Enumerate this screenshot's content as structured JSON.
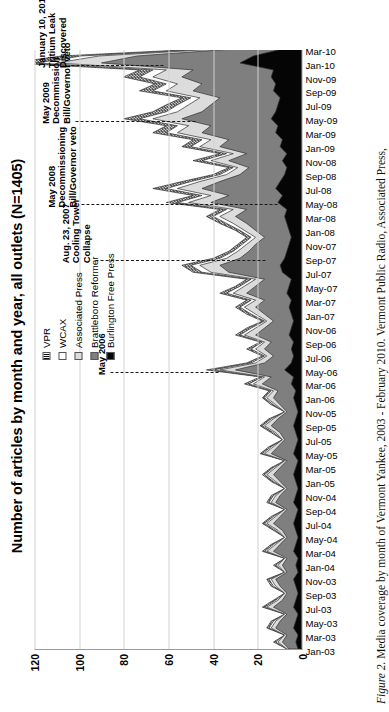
{
  "figure": {
    "caption_label": "Figure 2.",
    "caption_text": " Media coverage by month of Vermont Yankee, 2003 - February 2010. Vermont Public Radio, Associated Press,"
  },
  "legend": {
    "position": "top-right",
    "items": [
      {
        "label": "VPR",
        "swatch": "hatched",
        "color": "#2b2b2b"
      },
      {
        "label": "WCAX",
        "swatch": "white",
        "color": "#ffffff"
      },
      {
        "label": "Associated Press",
        "swatch": "light-gray",
        "color": "#dcdcdc"
      },
      {
        "label": "Brattleboro Reformer",
        "swatch": "mid-gray",
        "color": "#7f7f7f"
      },
      {
        "label": "Burlington Free Press",
        "swatch": "black",
        "color": "#050505"
      }
    ]
  },
  "annotations": [
    {
      "id": "may-2006",
      "lines": [
        "May 2006"
      ]
    },
    {
      "id": "cooling-tower",
      "lines": [
        "Aug. 23, 2007",
        "Cooling Tower",
        "Collapse"
      ]
    },
    {
      "id": "may-2008-veto",
      "lines": [
        "May 2008",
        "Decommissioning",
        "Bill/Governor veto"
      ]
    },
    {
      "id": "may-2009-veto",
      "lines": [
        "May 2009",
        "Decommission",
        "Bill/Governor veto"
      ]
    },
    {
      "id": "tritium-leak",
      "lines": [
        "January 10, 2010",
        "Tritium Leak",
        "Discovered"
      ]
    }
  ],
  "chart_data": {
    "type": "area",
    "title": "Number of articles by month and year, all outlets (N=1405)",
    "xlabel": "",
    "ylabel": "",
    "ylim": [
      0,
      120
    ],
    "yticks": [
      0,
      20,
      40,
      60,
      80,
      100,
      120
    ],
    "grid": true,
    "stacked": true,
    "categories": [
      "Jan-03",
      "Feb-03",
      "Mar-03",
      "Apr-03",
      "May-03",
      "Jun-03",
      "Jul-03",
      "Aug-03",
      "Sep-03",
      "Oct-03",
      "Nov-03",
      "Dec-03",
      "Jan-04",
      "Feb-04",
      "Mar-04",
      "Apr-04",
      "May-04",
      "Jun-04",
      "Jul-04",
      "Aug-04",
      "Sep-04",
      "Oct-04",
      "Nov-04",
      "Dec-04",
      "Jan-05",
      "Feb-05",
      "Mar-05",
      "Apr-05",
      "May-05",
      "Jun-05",
      "Jul-05",
      "Aug-05",
      "Sep-05",
      "Oct-05",
      "Nov-05",
      "Dec-05",
      "Jan-06",
      "Feb-06",
      "Mar-06",
      "Apr-06",
      "May-06",
      "Jun-06",
      "Jul-06",
      "Aug-06",
      "Sep-06",
      "Oct-06",
      "Nov-06",
      "Dec-06",
      "Jan-07",
      "Feb-07",
      "Mar-07",
      "Apr-07",
      "May-07",
      "Jun-07",
      "Jul-07",
      "Aug-07",
      "Sep-07",
      "Oct-07",
      "Nov-07",
      "Dec-07",
      "Jan-08",
      "Feb-08",
      "Mar-08",
      "Apr-08",
      "May-08",
      "Jun-08",
      "Jul-08",
      "Aug-08",
      "Sep-08",
      "Oct-08",
      "Nov-08",
      "Dec-08",
      "Jan-09",
      "Feb-09",
      "Mar-09",
      "Apr-09",
      "May-09",
      "Jun-09",
      "Jul-09",
      "Aug-09",
      "Sep-09",
      "Oct-09",
      "Nov-09",
      "Dec-09",
      "Jan-10",
      "Feb-10",
      "Mar-10"
    ],
    "tick_labels": [
      "Jan-03",
      "Mar-03",
      "May-03",
      "Jul-03",
      "Sep-03",
      "Nov-03",
      "Jan-04",
      "Mar-04",
      "May-04",
      "Jul-04",
      "Sep-04",
      "Nov-04",
      "Jan-05",
      "Mar-05",
      "May-05",
      "Jul-05",
      "Sep-05",
      "Nov-05",
      "Jan-06",
      "Mar-06",
      "May-06",
      "Jul-06",
      "Sep-06",
      "Nov-06",
      "Jan-07",
      "Mar-07",
      "May-07",
      "Jul-07",
      "Sep-07",
      "Nov-07",
      "Jan-08",
      "Mar-08",
      "May-08",
      "Jul-08",
      "Sep-08",
      "Nov-08",
      "Jan-09",
      "Mar-09",
      "May-09",
      "Jul-09",
      "Sep-09",
      "Nov-09",
      "Jan-10",
      "Mar-10"
    ],
    "series": [
      {
        "name": "Burlington Free Press",
        "color": "#050505",
        "values": [
          2,
          3,
          2,
          4,
          3,
          2,
          4,
          3,
          2,
          3,
          4,
          2,
          3,
          2,
          4,
          3,
          2,
          3,
          4,
          3,
          2,
          4,
          3,
          2,
          3,
          4,
          3,
          2,
          4,
          3,
          2,
          3,
          4,
          3,
          2,
          3,
          4,
          3,
          5,
          4,
          8,
          5,
          4,
          5,
          4,
          6,
          5,
          4,
          5,
          6,
          5,
          7,
          6,
          5,
          9,
          10,
          8,
          7,
          6,
          5,
          6,
          7,
          8,
          7,
          11,
          9,
          12,
          10,
          8,
          7,
          9,
          7,
          10,
          9,
          12,
          11,
          14,
          12,
          11,
          10,
          13,
          12,
          14,
          13,
          28,
          22,
          9
        ]
      },
      {
        "name": "Brattleboro Reformer",
        "color": "#7f7f7f",
        "values": [
          4,
          6,
          5,
          8,
          7,
          5,
          9,
          6,
          5,
          7,
          8,
          5,
          6,
          5,
          9,
          7,
          5,
          6,
          9,
          7,
          5,
          8,
          7,
          5,
          7,
          9,
          7,
          5,
          10,
          8,
          6,
          7,
          10,
          8,
          5,
          7,
          9,
          8,
          13,
          10,
          22,
          12,
          9,
          12,
          10,
          15,
          12,
          9,
          12,
          15,
          12,
          18,
          15,
          12,
          24,
          27,
          20,
          17,
          15,
          12,
          15,
          18,
          22,
          18,
          30,
          24,
          33,
          27,
          20,
          17,
          24,
          18,
          27,
          24,
          33,
          30,
          40,
          33,
          30,
          27,
          36,
          33,
          40,
          36,
          62,
          52,
          22
        ]
      },
      {
        "name": "Associated Press",
        "color": "#dcdcdc",
        "values": [
          1,
          2,
          1,
          2,
          2,
          1,
          3,
          2,
          1,
          2,
          2,
          1,
          2,
          1,
          3,
          2,
          1,
          2,
          3,
          2,
          1,
          2,
          2,
          1,
          2,
          3,
          2,
          1,
          3,
          2,
          1,
          2,
          3,
          2,
          1,
          2,
          3,
          2,
          4,
          3,
          7,
          4,
          3,
          4,
          3,
          5,
          4,
          3,
          4,
          5,
          4,
          6,
          5,
          4,
          8,
          9,
          6,
          5,
          4,
          4,
          5,
          6,
          7,
          6,
          10,
          8,
          11,
          9,
          6,
          5,
          8,
          6,
          9,
          8,
          11,
          10,
          13,
          11,
          10,
          9,
          12,
          11,
          13,
          12,
          20,
          17,
          7
        ]
      },
      {
        "name": "WCAX",
        "color": "#ffffff",
        "values": [
          0,
          1,
          0,
          1,
          1,
          0,
          1,
          1,
          0,
          1,
          1,
          0,
          1,
          0,
          1,
          1,
          0,
          1,
          1,
          1,
          0,
          1,
          1,
          0,
          1,
          1,
          1,
          0,
          1,
          1,
          0,
          1,
          1,
          1,
          0,
          1,
          1,
          1,
          2,
          1,
          3,
          2,
          1,
          2,
          1,
          2,
          2,
          1,
          2,
          2,
          2,
          3,
          2,
          2,
          4,
          4,
          3,
          2,
          2,
          2,
          2,
          3,
          3,
          3,
          5,
          4,
          5,
          4,
          3,
          2,
          4,
          3,
          4,
          4,
          5,
          5,
          6,
          5,
          5,
          4,
          6,
          5,
          6,
          6,
          9,
          8,
          3
        ]
      },
      {
        "name": "VPR",
        "color": "#2b2b2b",
        "values": [
          0,
          1,
          0,
          1,
          1,
          0,
          1,
          1,
          0,
          1,
          1,
          0,
          1,
          0,
          1,
          1,
          0,
          1,
          1,
          1,
          0,
          1,
          1,
          0,
          1,
          1,
          1,
          0,
          1,
          1,
          0,
          1,
          1,
          1,
          0,
          1,
          1,
          1,
          2,
          1,
          3,
          2,
          1,
          2,
          1,
          2,
          2,
          1,
          2,
          2,
          2,
          3,
          2,
          2,
          4,
          4,
          3,
          2,
          2,
          2,
          2,
          3,
          3,
          3,
          5,
          4,
          6,
          4,
          3,
          2,
          4,
          3,
          4,
          4,
          6,
          5,
          7,
          6,
          5,
          4,
          6,
          5,
          7,
          6,
          11,
          9,
          4
        ]
      }
    ]
  }
}
